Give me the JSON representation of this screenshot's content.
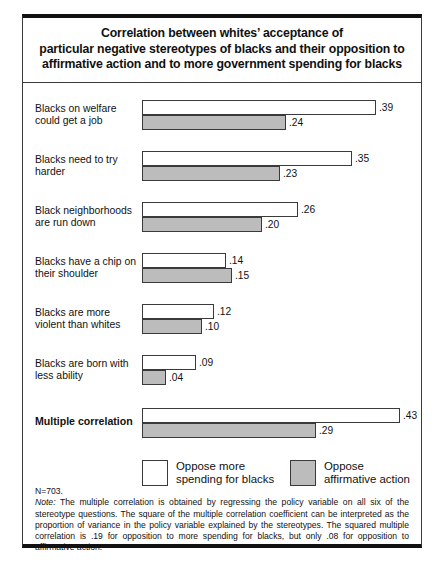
{
  "title": {
    "line1": "Correlation between whites’ acceptance of",
    "line2": "particular negative stereotypes of blacks and their opposition to",
    "line3": "affirmative action and to more government spending for blacks"
  },
  "legend": {
    "items": [
      {
        "label_line1": "Oppose more",
        "label_line2": "spending for blacks",
        "color": "#ffffff"
      },
      {
        "label_line1": "Oppose",
        "label_line2": "affirmative action",
        "color": "#bcbcbc"
      }
    ]
  },
  "footnote": {
    "n": "N=703.",
    "note_label": "Note:",
    "note_text": " The multiple correlation is obtained by regressing the policy variable on all six of the stereotype questions. The square of the multiple correlation coefficient can be interpreted as the proportion of variance in the policy variable explained by the stereotypes. The squared multiple correlation is .19 for opposition to more spending for blacks, but only .08 for opposition to affirmative action."
  },
  "chart_data": {
    "type": "bar",
    "orientation": "horizontal",
    "title": "Correlation between whites’ acceptance of particular negative stereotypes of blacks and their opposition to affirmative action and to more government spending for blacks",
    "xlabel": "",
    "ylabel": "",
    "xlim": [
      0,
      0.43
    ],
    "grid": false,
    "legend_position": "bottom",
    "categories": [
      "Blacks on welfare could get a job",
      "Blacks need to try harder",
      "Black neighborhoods are run down",
      "Blacks have a chip on their shoulder",
      "Blacks are more violent than whites",
      "Blacks are born with less ability",
      "Multiple correlation"
    ],
    "series": [
      {
        "name": "Oppose more spending for blacks",
        "color": "#ffffff",
        "values": [
          0.39,
          0.35,
          0.26,
          0.14,
          0.12,
          0.09,
          0.43
        ],
        "labels": [
          ".39",
          ".35",
          ".26",
          ".14",
          ".12",
          ".09",
          ".43"
        ]
      },
      {
        "name": "Oppose affirmative action",
        "color": "#bcbcbc",
        "values": [
          0.24,
          0.23,
          0.2,
          0.15,
          0.1,
          0.04,
          0.29
        ],
        "labels": [
          ".24",
          ".23",
          ".20",
          ".15",
          ".10",
          ".04",
          ".29"
        ]
      }
    ],
    "groups": [
      {
        "label_line1": "Blacks on welfare",
        "label_line2": "could get a job",
        "emphasis": false,
        "white": {
          "value": 0.39,
          "label": ".39"
        },
        "gray": {
          "value": 0.24,
          "label": ".24"
        }
      },
      {
        "label_line1": "Blacks need to try",
        "label_line2": "harder",
        "emphasis": false,
        "white": {
          "value": 0.35,
          "label": ".35"
        },
        "gray": {
          "value": 0.23,
          "label": ".23"
        }
      },
      {
        "label_line1": "Black neighborhoods",
        "label_line2": "are run down",
        "emphasis": false,
        "white": {
          "value": 0.26,
          "label": ".26"
        },
        "gray": {
          "value": 0.2,
          "label": ".20"
        }
      },
      {
        "label_line1": "Blacks have a chip on",
        "label_line2": "their shoulder",
        "emphasis": false,
        "white": {
          "value": 0.14,
          "label": ".14"
        },
        "gray": {
          "value": 0.15,
          "label": ".15"
        }
      },
      {
        "label_line1": "Blacks are more",
        "label_line2": "violent than whites",
        "emphasis": false,
        "white": {
          "value": 0.12,
          "label": ".12"
        },
        "gray": {
          "value": 0.1,
          "label": ".10"
        }
      },
      {
        "label_line1": "Blacks are born with",
        "label_line2": "less ability",
        "emphasis": false,
        "white": {
          "value": 0.09,
          "label": ".09"
        },
        "gray": {
          "value": 0.04,
          "label": ".04"
        }
      },
      {
        "label_line1": "Multiple correlation",
        "label_line2": "",
        "emphasis": true,
        "white": {
          "value": 0.43,
          "label": ".43"
        },
        "gray": {
          "value": 0.29,
          "label": ".29"
        }
      }
    ]
  }
}
